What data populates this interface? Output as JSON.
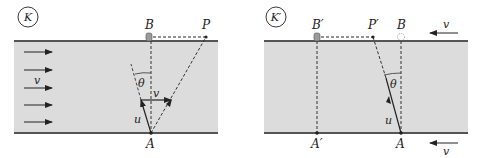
{
  "colors": {
    "river": "#dcdcdc",
    "bank": "#555555",
    "ink": "#222222",
    "boat": "#9a9a9a"
  },
  "left_panel": {
    "frame_label": "K",
    "labels": {
      "B": "B",
      "P": "P",
      "A": "A",
      "theta": "θ",
      "u": "u",
      "v_boat": "v",
      "v_current": "v"
    },
    "current_arrows": 5
  },
  "right_panel": {
    "frame_label": "K′",
    "labels": {
      "B_prime": "B′",
      "P_prime": "P′",
      "B": "B",
      "A_prime": "A′",
      "A": "A",
      "theta": "θ",
      "u": "u",
      "v_top": "v",
      "v_bottom": "v"
    }
  }
}
